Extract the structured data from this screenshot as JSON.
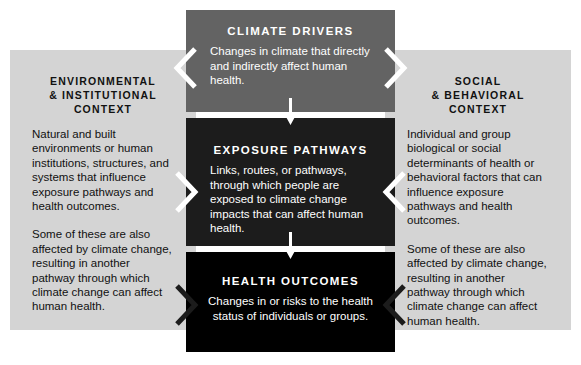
{
  "diagram": {
    "colors": {
      "panel_gray": "#d4d4d4",
      "drivers_box": "#636363",
      "pathways_box": "#1c1c1c",
      "outcomes_box": "#000000",
      "box_text": "#ffffff",
      "panel_text": "#111111",
      "arrow_white": "#ffffff",
      "chevron_white": "#ffffff",
      "chevron_dark": "#1c1c1c",
      "background": "#ffffff"
    },
    "center_nodes": [
      {
        "id": "climate-drivers",
        "title": "CLIMATE DRIVERS",
        "body": "Changes in climate that directly and indirectly affect human health."
      },
      {
        "id": "exposure-pathways",
        "title": "EXPOSURE PATHWAYS",
        "body": "Links, routes, or pathways, through which people are exposed to climate change impacts that can affect human health."
      },
      {
        "id": "health-outcomes",
        "title": "HEALTH OUTCOMES",
        "body": "Changes in or risks to the health status of individuals or groups."
      }
    ],
    "left_panel": {
      "title": "ENVIRONMENTAL\n& INSTITUTIONAL CONTEXT",
      "paragraph_1": "Natural and built environments or human institutions, structures, and systems that influence exposure pathways and health outcomes.",
      "paragraph_2": "Some of these are also affected by climate change, resulting in another pathway through which climate change can affect human health."
    },
    "right_panel": {
      "title": "SOCIAL\n& BEHAVIORAL CONTEXT",
      "paragraph_1": "Individual and group biological or social determinants of health or behavioral factors that can influence exposure pathways and health outcomes.",
      "paragraph_2": "Some of these are also affected by climate change, resulting in another pathway through which climate change can affect human health."
    },
    "connectors": {
      "flow_arrow_1": "down-arrow-icon",
      "flow_arrow_2": "down-arrow-icon",
      "chevron_drivers_left": "chevron-left-icon",
      "chevron_drivers_right": "chevron-right-icon",
      "chevron_pathways_left": "chevron-right-icon",
      "chevron_pathways_right": "chevron-left-icon",
      "chevron_outcomes_left": "chevron-right-icon",
      "chevron_outcomes_right": "chevron-left-icon"
    }
  }
}
